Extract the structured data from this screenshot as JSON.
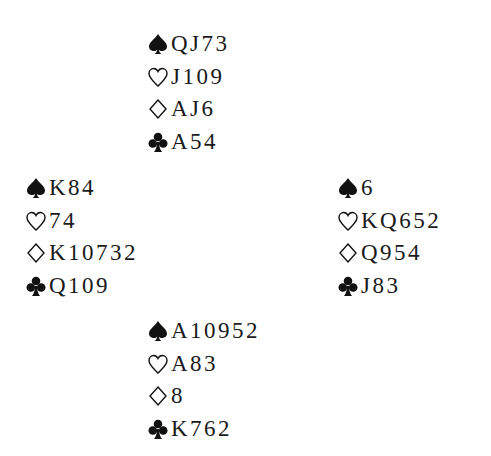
{
  "hands": {
    "north": {
      "spades": "QJ73",
      "hearts": "J109",
      "diamonds": "AJ6",
      "clubs": "A54"
    },
    "west": {
      "spades": "K84",
      "hearts": "74",
      "diamonds": "K10732",
      "clubs": "Q109"
    },
    "east": {
      "spades": "6",
      "hearts": "KQ652",
      "diamonds": "Q954",
      "clubs": "J83"
    },
    "south": {
      "spades": "A10952",
      "hearts": "A83",
      "diamonds": "8",
      "clubs": "K762"
    }
  },
  "suit_icons": {
    "spades": "spade-icon (filled)",
    "hearts": "heart-icon (outline)",
    "diamonds": "diamond-icon (outline)",
    "clubs": "club-icon (filled)"
  }
}
